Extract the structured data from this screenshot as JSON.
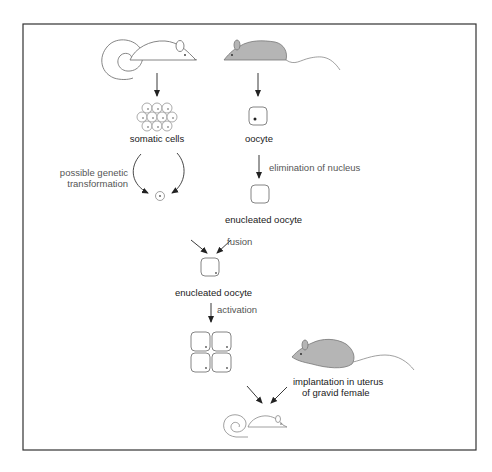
{
  "diagram": {
    "type": "flowchart",
    "frame": {
      "stroke": "#333333",
      "fill": "#ffffff"
    },
    "colors": {
      "line": "#333333",
      "mouse_fill_gray": "#b5b5b5",
      "mouse_outline": "#777777",
      "label_text": "#222222",
      "annotation_text": "#555555"
    },
    "nodes": [
      {
        "id": "donor_mouse",
        "kind": "mouse-white",
        "label": ""
      },
      {
        "id": "oocyte_donor_mouse",
        "kind": "mouse-gray",
        "label": ""
      },
      {
        "id": "somatic_cells",
        "kind": "cell-cluster",
        "label": "somatic cells"
      },
      {
        "id": "oocyte",
        "kind": "cell-nucleated",
        "label": "oocyte"
      },
      {
        "id": "transformed_cell",
        "kind": "single-cell",
        "label": ""
      },
      {
        "id": "enucleated_oocyte_1",
        "kind": "cell-empty",
        "label": "enucleated oocyte"
      },
      {
        "id": "enucleated_oocyte_2",
        "kind": "cell-with-nucleus",
        "label": "enucleated oocyte"
      },
      {
        "id": "embryo_4cell",
        "kind": "four-cell-embryo",
        "label": ""
      },
      {
        "id": "gravid_female",
        "kind": "mouse-gray",
        "label": ""
      },
      {
        "id": "clone_mouse",
        "kind": "mouse-white-small",
        "label": ""
      }
    ],
    "edges": [
      {
        "from": "donor_mouse",
        "to": "somatic_cells",
        "label": ""
      },
      {
        "from": "oocyte_donor_mouse",
        "to": "oocyte",
        "label": ""
      },
      {
        "from": "somatic_cells",
        "to": "transformed_cell",
        "label": "possible genetic transformation"
      },
      {
        "from": "oocyte",
        "to": "enucleated_oocyte_1",
        "label": "elimination of nucleus"
      },
      {
        "from": "transformed_cell",
        "to": "enucleated_oocyte_2",
        "label": ""
      },
      {
        "from": "enucleated_oocyte_1",
        "to": "enucleated_oocyte_2",
        "label": "fusion"
      },
      {
        "from": "enucleated_oocyte_2",
        "to": "embryo_4cell",
        "label": "activation"
      },
      {
        "from": "embryo_4cell",
        "to": "clone_mouse",
        "label": ""
      },
      {
        "from": "gravid_female",
        "to": "clone_mouse",
        "label": "implantation in uterus of gravid female"
      }
    ]
  },
  "labels": {
    "somatic_cells": "somatic cells",
    "oocyte": "oocyte",
    "possible_genetic": "possible genetic",
    "transformation": "transformation",
    "elimination_of_nucleus": "elimination of nucleus",
    "enucleated_oocyte_1": "enucleated oocyte",
    "fusion": "fusion",
    "enucleated_oocyte_2": "enucleated oocyte",
    "activation": "activation",
    "implantation_line1": "implantation in uterus",
    "implantation_line2": "of gravid female"
  }
}
